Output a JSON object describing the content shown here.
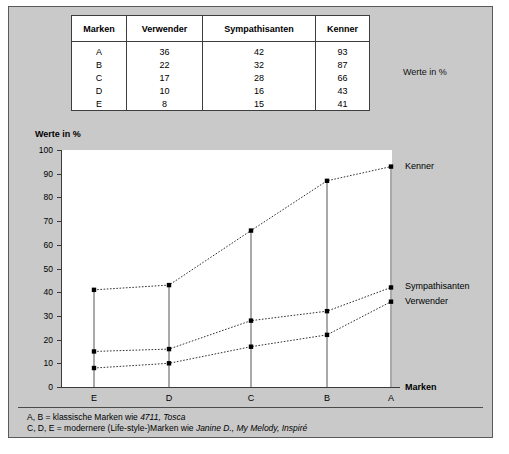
{
  "table": {
    "headers": [
      "Marken",
      "Verwender",
      "Sympathisanten",
      "Kenner"
    ],
    "rows": [
      [
        "A",
        "36",
        "42",
        "93"
      ],
      [
        "B",
        "22",
        "32",
        "87"
      ],
      [
        "C",
        "17",
        "28",
        "66"
      ],
      [
        "D",
        "10",
        "16",
        "43"
      ],
      [
        "E",
        "8",
        "15",
        "41"
      ]
    ],
    "side_note": "Werte in %"
  },
  "chart": {
    "title": "Werte in %",
    "xaxis_label": "Marken",
    "series_labels": {
      "kenner": "Kenner",
      "sympathisanten": "Sympathisanten",
      "verwender": "Verwender"
    }
  },
  "footnote": {
    "line1_pre": "A, B = klassische Marken wie ",
    "line1_italic": "4711, Tosca",
    "line2_pre": "C, D, E = modernere (Life-style-)Marken wie ",
    "line2_italic": "Janine D., My Melody, Inspiré"
  },
  "chart_data": {
    "type": "line",
    "title": "Werte in %",
    "xlabel": "Marken",
    "ylabel": "Werte in %",
    "categories": [
      "E",
      "D",
      "C",
      "B",
      "A"
    ],
    "ylim": [
      0,
      100
    ],
    "yticks": [
      0,
      10,
      20,
      30,
      40,
      50,
      60,
      70,
      80,
      90,
      100
    ],
    "grid": false,
    "legend_position": "right",
    "series": [
      {
        "name": "Kenner",
        "values": [
          41,
          43,
          66,
          87,
          93
        ]
      },
      {
        "name": "Sympathisanten",
        "values": [
          15,
          16,
          28,
          32,
          42
        ]
      },
      {
        "name": "Verwender",
        "values": [
          8,
          10,
          17,
          22,
          36
        ]
      }
    ]
  }
}
